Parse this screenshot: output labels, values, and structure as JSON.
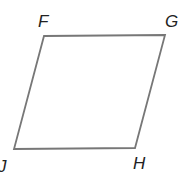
{
  "diagram": {
    "shape": "parallelogram",
    "stroke_color": "#777777",
    "label_color": "#222222",
    "vertices": [
      {
        "label": "F",
        "x": 44,
        "y": 36
      },
      {
        "label": "G",
        "x": 165,
        "y": 35
      },
      {
        "label": "H",
        "x": 135,
        "y": 148
      },
      {
        "label": "J",
        "x": 14,
        "y": 149
      }
    ]
  }
}
